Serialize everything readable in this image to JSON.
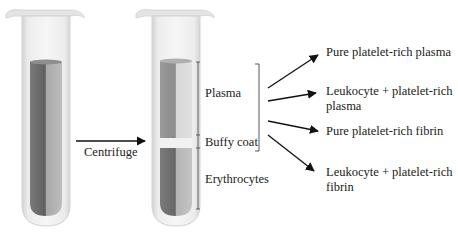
{
  "diagram": {
    "process_label": "Centrifuge",
    "tubes": [
      {
        "id": "whole-blood",
        "description": "Tube of whole blood before centrifugation"
      },
      {
        "id": "separated",
        "description": "Tube after centrifugation showing separated layers"
      }
    ],
    "layers": [
      {
        "label": "Plasma"
      },
      {
        "label": "Buffy coat"
      },
      {
        "label": "Erythrocytes"
      }
    ],
    "products": [
      {
        "line1": "Pure platelet-rich plasma",
        "line2": ""
      },
      {
        "line1": "Leukocyte + platelet-rich",
        "line2": "plasma"
      },
      {
        "line1": "Pure platelet-rich fibrin",
        "line2": ""
      },
      {
        "line1": "Leukocyte + platelet-rich",
        "line2": "fibrin"
      }
    ],
    "colors": {
      "tube_glass": "#e6e6e6",
      "tube_edge": "#cfcfcf",
      "blood_dark": "#6f6f6f",
      "blood_light": "#a9a9a9",
      "plasma_dark": "#8a8a8a",
      "plasma_light": "#d4d4d4",
      "buffy": "#f2f2f2",
      "ink": "#111111"
    }
  }
}
